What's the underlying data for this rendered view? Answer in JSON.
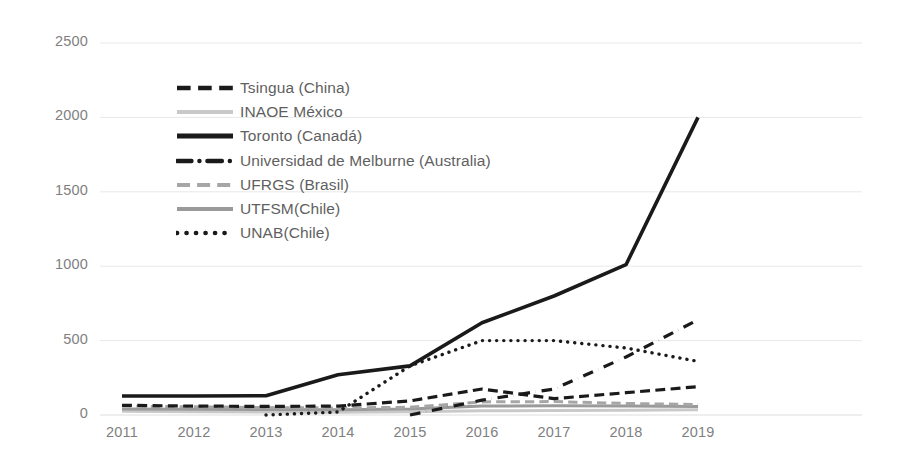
{
  "chart_data": {
    "type": "line",
    "title": "",
    "subtitle": "",
    "xlabel": "",
    "ylabel": "",
    "x": [
      2011,
      2012,
      2013,
      2014,
      2015,
      2016,
      2017,
      2018,
      2019
    ],
    "categories": [
      "2011",
      "2012",
      "2013",
      "2014",
      "2015",
      "2016",
      "2017",
      "2018",
      "2019"
    ],
    "ylim": [
      0,
      2500
    ],
    "yticks": [
      0,
      500,
      1000,
      1500,
      2000,
      2500
    ],
    "ytick_labels": [
      "0",
      "500",
      "1000",
      "1500",
      "2000",
      "2500"
    ],
    "grid": "horizontal",
    "legend_position": "inside-upper-left",
    "series": [
      {
        "name": "Tsingua (China)",
        "style": "dashed",
        "color": "#1a1a1a",
        "width": 3.2,
        "values": [
          65,
          60,
          58,
          60,
          95,
          175,
          110,
          150,
          190
        ]
      },
      {
        "name": "INAOE México",
        "style": "solid",
        "color": "#c9c9c9",
        "width": 3.0,
        "values": [
          25,
          22,
          20,
          18,
          22,
          28,
          30,
          32,
          35
        ]
      },
      {
        "name": "Toronto (Canadá)",
        "style": "solid",
        "color": "#1a1a1a",
        "width": 3.6,
        "values": [
          128,
          128,
          130,
          270,
          330,
          620,
          800,
          1010,
          2000
        ]
      },
      {
        "name": "Universidad de Melburne (Australia)",
        "style": "dash-dot",
        "color": "#1a1a1a",
        "width": 3.2,
        "values": [
          0,
          0,
          0,
          0,
          0,
          100,
          175,
          390,
          640
        ]
      },
      {
        "name": "UFRGS (Brasil)",
        "style": "dashed",
        "color": "#a6a6a6",
        "width": 3.0,
        "values": [
          60,
          55,
          50,
          48,
          52,
          88,
          90,
          78,
          70
        ]
      },
      {
        "name": "UTFSM(Chile)",
        "style": "solid",
        "color": "#9a9a9a",
        "width": 3.0,
        "values": [
          40,
          38,
          36,
          35,
          40,
          60,
          62,
          60,
          58
        ]
      },
      {
        "name": "UNAB(Chile)",
        "style": "dotted",
        "color": "#1a1a1a",
        "width": 3.4,
        "values": [
          0,
          0,
          0,
          20,
          330,
          500,
          500,
          450,
          360
        ]
      }
    ]
  },
  "axis": {
    "y_labels": [
      "2500",
      "2000",
      "1500",
      "1000",
      "500",
      "0"
    ],
    "x_labels": [
      "2011",
      "2012",
      "2013",
      "2014",
      "2015",
      "2016",
      "2017",
      "2018",
      "2019"
    ]
  },
  "legend": {
    "items": [
      {
        "label": "Tsingua (China)"
      },
      {
        "label": "INAOE México"
      },
      {
        "label": "Toronto (Canadá)"
      },
      {
        "label": "Universidad de Melburne (Australia)"
      },
      {
        "label": "UFRGS (Brasil)"
      },
      {
        "label": "UTFSM(Chile)"
      },
      {
        "label": "UNAB(Chile)"
      }
    ]
  },
  "colors": {
    "grid": "#e8e8e8",
    "tick_text": "#7f7f7f",
    "legend_text": "#5f5f5f",
    "dark_series": "#1a1a1a",
    "light_series": "#c9c9c9",
    "background": "#ffffff"
  }
}
